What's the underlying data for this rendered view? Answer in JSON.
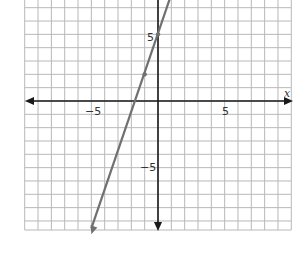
{
  "chart_data": {
    "type": "line",
    "title": "",
    "xlabel": "x",
    "ylabel": "",
    "xlim": [
      -10,
      10
    ],
    "ylim": [
      -9.7,
      7.6
    ],
    "grid": true,
    "grid_step": 1,
    "x_ticks": [
      {
        "value": -5,
        "label": "−5"
      },
      {
        "value": 5,
        "label": "5"
      }
    ],
    "y_ticks": [
      {
        "value": 5,
        "label": "5"
      },
      {
        "value": -5,
        "label": "−5"
      }
    ],
    "series": [
      {
        "name": "y = 3x + 5",
        "equation": "y = 3x + 5",
        "slope": 3,
        "intercept": 5,
        "x": [
          -5,
          -1,
          0,
          1.1
        ],
        "y": [
          -10,
          2,
          5,
          8.3
        ],
        "marked_points": [
          {
            "x": 0,
            "y": 5
          },
          {
            "x": -1,
            "y": 2
          }
        ],
        "color": "#707070"
      }
    ]
  },
  "labels": {
    "x_axis": "x",
    "x_tick_neg5": "−5",
    "x_tick_5": "5",
    "y_tick_5": "5",
    "y_tick_neg5": "−5"
  },
  "colors": {
    "grid": "#b8b8b8",
    "axis": "#1a1a1a",
    "line": "#707070"
  }
}
